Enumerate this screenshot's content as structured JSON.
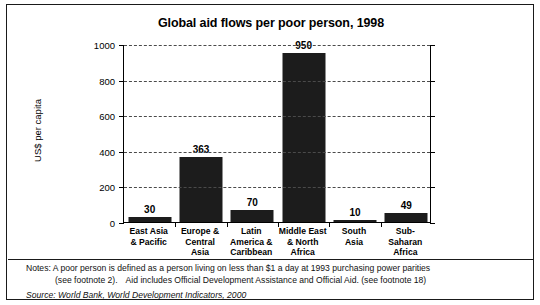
{
  "chart_data": {
    "type": "bar",
    "title": "Global aid flows per poor person, 1998",
    "xlabel": "",
    "ylabel": "US$ per capita",
    "ylim": [
      0,
      1000
    ],
    "yticks": [
      0,
      200,
      400,
      600,
      800,
      1000
    ],
    "ytick_labels": [
      "0",
      "200",
      "400",
      "600",
      "800",
      "1000"
    ],
    "grid": "horizontal-dashed",
    "legend": "none",
    "bar_color": "#1c1c1c",
    "categories": [
      "East Asia & Pacific",
      "Europe & Central Asia",
      "Latin America & Caribbean",
      "Middle East & North Africa",
      "South Asia",
      "Sub-Saharan Africa"
    ],
    "category_label_lines": [
      [
        "East Asia",
        "& Pacific"
      ],
      [
        "Europe &",
        "Central",
        "Asia"
      ],
      [
        "Latin",
        "America &",
        "Caribbean"
      ],
      [
        "Middle East",
        "& North",
        "Africa"
      ],
      [
        "South",
        "Asia"
      ],
      [
        "Sub-Saharan",
        "Africa"
      ]
    ],
    "values": [
      30,
      363,
      70,
      950,
      10,
      49
    ],
    "value_labels": [
      "30",
      "363",
      "70",
      "950",
      "10",
      "49"
    ]
  },
  "notes": {
    "line1_prefix": "Notes:",
    "line1": "Notes: A poor person is defined as a person living on less than $1 a day at 1993 purchasing power parities",
    "line2_a": "(see footnote 2).",
    "line2_b": "Aid includes Official Development Assistance and Official Aid. (see footnote 18)",
    "source": "Source: World Bank, World Development Indicators, 2000"
  }
}
